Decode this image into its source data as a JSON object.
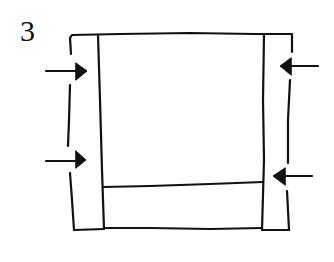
{
  "figure": {
    "label": "3",
    "stroke_color": "#111111",
    "background": "#ffffff"
  },
  "shapes": {
    "outer_frame": "rectangle",
    "left_strip": "vertical-strip",
    "right_strip": "vertical-strip",
    "bottom_strip": "horizontal-strip"
  },
  "arrows": [
    {
      "side": "left",
      "direction": "right",
      "position": "upper"
    },
    {
      "side": "left",
      "direction": "right",
      "position": "lower"
    },
    {
      "side": "right",
      "direction": "left",
      "position": "upper"
    },
    {
      "side": "right",
      "direction": "left",
      "position": "lower"
    }
  ]
}
